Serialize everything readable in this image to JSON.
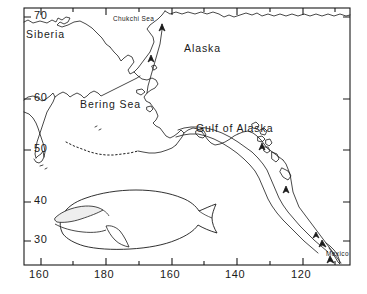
{
  "figure": {
    "type": "map",
    "background_color": "#ffffff",
    "line_color": "#1a1a1a"
  },
  "frame": {
    "left": 24,
    "top": 8,
    "right": 350,
    "bottom": 265
  },
  "axes": {
    "x": {
      "label_texts": [
        "160",
        "180",
        "160",
        "140",
        "120"
      ],
      "label_x": [
        41,
        106,
        172,
        237,
        303
      ],
      "tick_x": [
        41,
        73,
        106,
        139,
        172,
        204,
        237,
        270,
        303,
        335
      ],
      "major_tick_x": [
        41,
        106,
        172,
        237,
        303
      ]
    },
    "y": {
      "label_texts": [
        "70",
        "60",
        "50",
        "40",
        "30"
      ],
      "label_y": [
        17,
        99,
        150,
        202,
        241
      ],
      "tick_y": [
        17,
        99,
        150,
        202,
        241
      ]
    }
  },
  "labels": {
    "siberia": "Siberia",
    "alaska": "Alaska",
    "bering_sea": "Bering Sea",
    "chukchi_sea": "Chukchi Sea",
    "gulf_of_alaska": "Gulf of Alaska",
    "mexico": "Mexico"
  },
  "label_positions": {
    "siberia": {
      "x": 26,
      "y": 28
    },
    "alaska": {
      "x": 184,
      "y": 42
    },
    "bering_sea": {
      "x": 80,
      "y": 98
    },
    "chukchi_sea": {
      "x": 113,
      "y": 15
    },
    "gulf_of_alaska": {
      "x": 196,
      "y": 122
    },
    "mexico": {
      "x": 326,
      "y": 253
    }
  },
  "whale_illustration": {
    "name": "bowhead-whale-drawing",
    "facing": "left",
    "bounds": {
      "x": 50,
      "y": 188,
      "width": 170,
      "height": 62
    }
  },
  "migration_arrows": {
    "count": 6,
    "description": "Arrows along the North American coast and into the Chukchi Sea indicating whale migration direction"
  }
}
